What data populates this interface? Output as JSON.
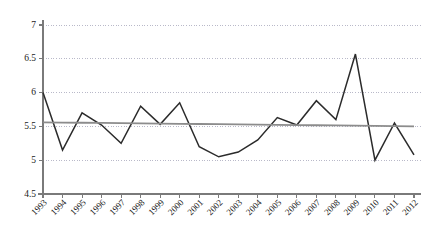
{
  "chart_data": {
    "type": "line",
    "title": "",
    "subtitle": "",
    "xlabel": "",
    "ylabel": "",
    "grid": true,
    "grid_style": "dotted-horizontal",
    "legend": false,
    "legend_position": "none",
    "xlim_categories": [
      "1993",
      "2012"
    ],
    "ylim": [
      4.5,
      7
    ],
    "ytick_step": 0.5,
    "categories": [
      "1993",
      "1994",
      "1995",
      "1996",
      "1997",
      "1998",
      "1999",
      "2000",
      "2001",
      "2002",
      "2003",
      "2004",
      "2005",
      "2006",
      "2007",
      "2008",
      "2009",
      "2010",
      "2011",
      "2012"
    ],
    "ytick_labels": [
      "4.5",
      "5",
      "5.5",
      "6",
      "6.5",
      "7"
    ],
    "ytick_values": [
      4.5,
      5,
      5.5,
      6,
      6.5,
      7
    ],
    "series": [
      {
        "name": "series-1",
        "kind": "line",
        "color": "#2b2b2b",
        "values": [
          6.0,
          5.15,
          5.7,
          5.52,
          5.25,
          5.8,
          5.53,
          5.85,
          5.2,
          5.05,
          5.12,
          5.3,
          5.63,
          5.52,
          5.88,
          5.6,
          6.57,
          5.0,
          5.55,
          5.08
        ]
      },
      {
        "name": "trendline",
        "kind": "line",
        "color": "#8c8c8c",
        "values": [
          5.56,
          5.557,
          5.5539,
          5.5508,
          5.5477,
          5.5446,
          5.5415,
          5.5385,
          5.5354,
          5.5323,
          5.5292,
          5.5261,
          5.5231,
          5.52,
          5.5169,
          5.5138,
          5.5107,
          5.5077,
          5.5046,
          5.5
        ]
      }
    ],
    "colors": {
      "data_line": "#2b2b2b",
      "trend_line": "#8c8c8c",
      "axis": "#7a7a7a",
      "grid": "#b9b9c9",
      "text": "#1a1a1a",
      "background": "#ffffff"
    }
  }
}
